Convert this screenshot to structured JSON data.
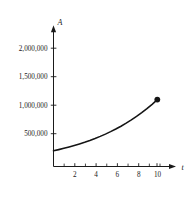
{
  "chart_data": {
    "type": "line",
    "title": "",
    "subtitle": "",
    "xlabel": "t",
    "ylabel": "A",
    "xlim": [
      0,
      11.8
    ],
    "ylim": [
      0,
      2250000
    ],
    "grid": false,
    "legend": null,
    "x_ticks_major": [
      2,
      4,
      6,
      8,
      10
    ],
    "x_tick_labels": [
      "2",
      "4",
      "6",
      "8",
      "10"
    ],
    "x_ticks_minor": [
      1,
      3,
      5,
      7,
      9,
      11
    ],
    "y_ticks": [
      500000,
      1000000,
      1500000,
      2000000
    ],
    "y_tick_labels": [
      "500,000",
      "1,000,000",
      "1,500,000",
      "2,000,000"
    ],
    "series": [
      {
        "name": "A(t)",
        "x": [
          0,
          0.5,
          1,
          1.5,
          2,
          2.5,
          3,
          3.5,
          4,
          4.5,
          5,
          5.5,
          6,
          6.5,
          7,
          7.5,
          8,
          8.5,
          9,
          9.5,
          10
        ],
        "values": [
          250000,
          268800,
          289000,
          310700,
          334100,
          359200,
          386200,
          415200,
          446400,
          480000,
          516100,
          554900,
          596600,
          641400,
          689600,
          741400,
          797100,
          857000,
          921400,
          990600,
          1065000
        ]
      }
    ],
    "annotations": [
      {
        "name": "endpoint-marker",
        "x": 10,
        "y": 1065000,
        "marker": "filled-circle"
      }
    ],
    "axis_arrows": {
      "x": "right",
      "y": "up"
    }
  },
  "figure": {
    "background_color": "#ffffff",
    "curve_color": "#141414",
    "axis_color": "#1a1a1a",
    "text_color": "#1a1a1a"
  }
}
